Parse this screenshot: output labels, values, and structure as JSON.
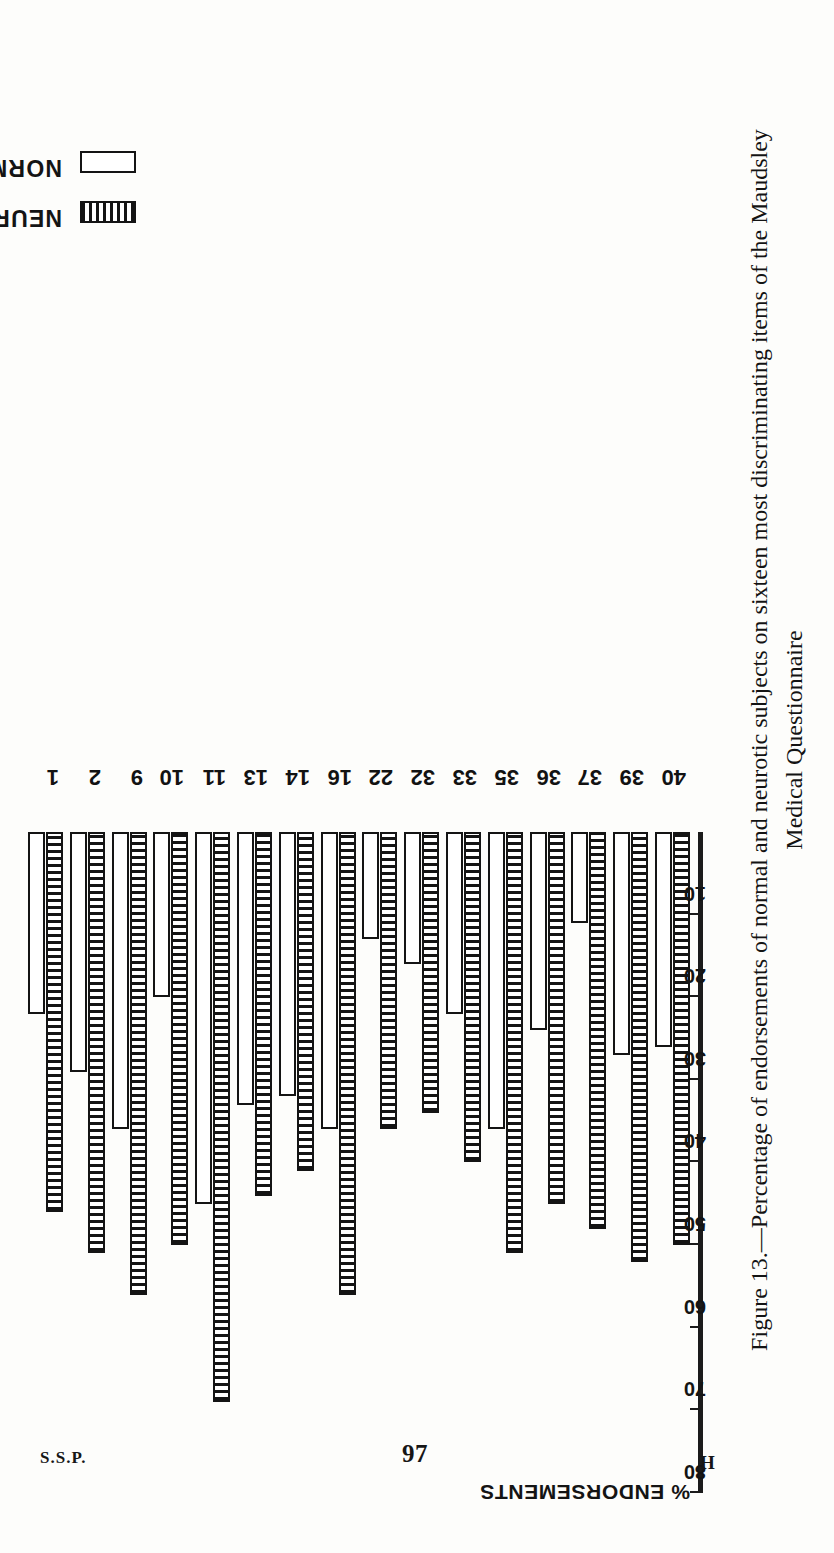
{
  "page": {
    "signature_mark": "S.S.P.",
    "page_number": "97",
    "signature_letter": "H"
  },
  "caption": {
    "line1": "Figure 13.—Percentage of endorsements of normal and neurotic subjects on sixteen most discriminating items of the Maudsley",
    "line2": "Medical Questionnaire"
  },
  "legend": {
    "items": [
      {
        "label": "NEUROTICS",
        "swatch": "hatched"
      },
      {
        "label": "NORMALS",
        "swatch": "open"
      }
    ]
  },
  "axis": {
    "title": "% ENDORSEMENTS",
    "ticks": [
      "80",
      "70",
      "60",
      "50",
      "40",
      "30",
      "20",
      "10"
    ]
  },
  "chart_data": {
    "type": "bar",
    "orientation": "horizontal",
    "title": "Figure 13.—Percentage of endorsements of normal and neurotic subjects on sixteen most discriminating items of the Maudsley Medical Questionnaire",
    "xlabel": "% ENDORSEMENTS",
    "ylabel": "",
    "xlim": [
      0,
      80
    ],
    "grid": false,
    "legend_position": "top-left",
    "categories": [
      "1",
      "2",
      "9",
      "10",
      "11",
      "13",
      "14",
      "16",
      "22",
      "32",
      "33",
      "35",
      "36",
      "37",
      "39",
      "40"
    ],
    "series": [
      {
        "name": "NEUROTICS",
        "color": "#141414",
        "fill": "vertical-hatch",
        "values": [
          46,
          51,
          56,
          50,
          69,
          44,
          41,
          56,
          36,
          34,
          40,
          51,
          45,
          48,
          52,
          50
        ]
      },
      {
        "name": "NORMALS",
        "color": "#ffffff",
        "fill": "open",
        "values": [
          22,
          29,
          36,
          20,
          45,
          33,
          32,
          36,
          13,
          16,
          22,
          36,
          24,
          11,
          27,
          26
        ]
      }
    ]
  }
}
